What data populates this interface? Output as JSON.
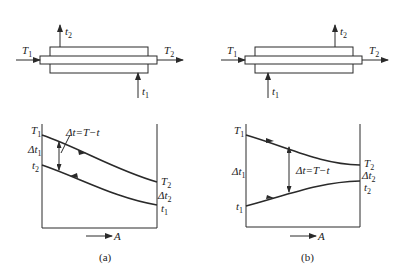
{
  "figure": {
    "panels": [
      {
        "id": "a",
        "caption": "(a)",
        "flow": "counter-current",
        "exchanger": {
          "hot_in": {
            "sym": "T",
            "sub": "1"
          },
          "hot_out": {
            "sym": "T",
            "sub": "2"
          },
          "cold_in": {
            "sym": "t",
            "sub": "1"
          },
          "cold_out": {
            "sym": "t",
            "sub": "2"
          }
        },
        "plot": {
          "upper_start": {
            "sym": "T",
            "sub": "1"
          },
          "lower_start": {
            "sym": "t",
            "sub": "2"
          },
          "delta_start": {
            "sym": "Δt",
            "sub": "1"
          },
          "upper_end": {
            "sym": "T",
            "sub": "2"
          },
          "delta_end": {
            "sym": "Δt",
            "sub": "2"
          },
          "lower_end": {
            "sym": "t",
            "sub": "1"
          },
          "delta_formula": "Δt=T−t",
          "x_axis": "A"
        }
      },
      {
        "id": "b",
        "caption": "(b)",
        "flow": "co-current",
        "exchanger": {
          "hot_in": {
            "sym": "T",
            "sub": "1"
          },
          "hot_out": {
            "sym": "T",
            "sub": "2"
          },
          "cold_in": {
            "sym": "t",
            "sub": "1"
          },
          "cold_out": {
            "sym": "t",
            "sub": "2"
          }
        },
        "plot": {
          "upper_start": {
            "sym": "T",
            "sub": "1"
          },
          "lower_start": {
            "sym": "t",
            "sub": "1"
          },
          "delta_start": {
            "sym": "Δt",
            "sub": "1"
          },
          "upper_end": {
            "sym": "T",
            "sub": "2"
          },
          "delta_end": {
            "sym": "Δt",
            "sub": "2"
          },
          "lower_end": {
            "sym": "t",
            "sub": "2"
          },
          "delta_formula": "Δt=T−t",
          "x_axis": "A"
        }
      }
    ]
  }
}
